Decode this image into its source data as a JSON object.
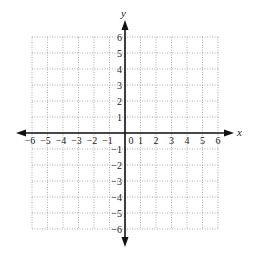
{
  "chart_data": {
    "type": "scatter",
    "title": "",
    "xlabel": "x",
    "ylabel": "y",
    "xlim": [
      -6,
      6
    ],
    "ylim": [
      -6,
      6
    ],
    "grid": true,
    "grid_style": "dotted",
    "x_ticks": [
      -6,
      -5,
      -4,
      -3,
      -2,
      -1,
      0,
      1,
      2,
      3,
      4,
      5,
      6
    ],
    "y_ticks": [
      -6,
      -5,
      -4,
      -3,
      -2,
      -1,
      1,
      2,
      3,
      4,
      5,
      6
    ],
    "x_tick_labels": [
      "−6",
      "−5",
      "−4",
      "−3",
      "−2",
      "−1",
      "0",
      "1",
      "2",
      "3",
      "4",
      "5",
      "6"
    ],
    "y_tick_labels": [
      "−6",
      "−5",
      "−4",
      "−3",
      "−2",
      "−1",
      "1",
      "2",
      "3",
      "4",
      "5",
      "6"
    ],
    "series": [],
    "legend": null
  },
  "colors": {
    "axis": "#111111",
    "grid": "#9a9a9a",
    "text": "#222222"
  }
}
